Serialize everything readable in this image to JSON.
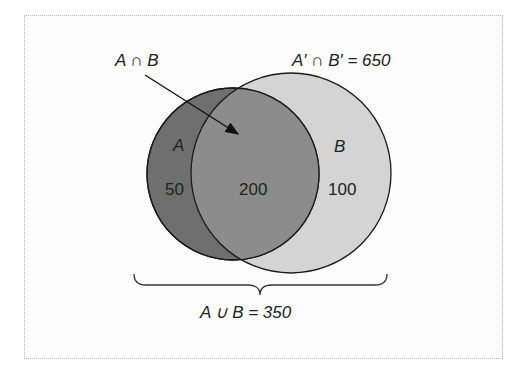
{
  "diagram": {
    "type": "venn",
    "sets": [
      {
        "name": "A",
        "only_count": "50",
        "color": "#6f6f6f"
      },
      {
        "name": "B",
        "only_count": "100",
        "color": "#d4d4d4"
      }
    ],
    "intersection": {
      "count": "200",
      "color": "#8c8c8c"
    },
    "labels": {
      "set_a": "A",
      "set_b": "B",
      "a_only": "50",
      "intersection_value": "200",
      "b_only": "100",
      "intersection_label": "A ∩ B",
      "complement_label": "A′ ∩ B′ = 650",
      "union_label": "A ∪ B = 350"
    }
  }
}
